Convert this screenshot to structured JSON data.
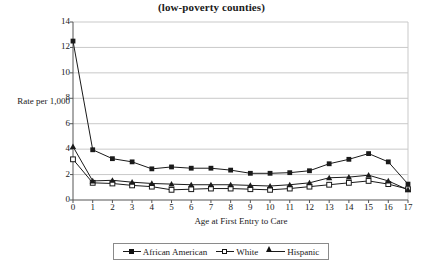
{
  "chart_data": {
    "type": "line",
    "title": "(low-poverty counties)",
    "xlabel": "Age at First Entry to Care",
    "ylabel": "Rate per 1,000",
    "x": [
      0,
      1,
      2,
      3,
      4,
      5,
      6,
      7,
      8,
      9,
      10,
      11,
      12,
      13,
      14,
      15,
      16,
      17
    ],
    "xlim": [
      0,
      17
    ],
    "ylim": [
      0,
      14
    ],
    "ytick_labels": [
      "0",
      "2",
      "4",
      "6",
      "8",
      "10",
      "12",
      "14"
    ],
    "ytick_values": [
      0,
      2,
      4,
      6,
      8,
      10,
      12,
      14
    ],
    "xtick_labels": [
      "0",
      "1",
      "2",
      "3",
      "4",
      "5",
      "6",
      "7",
      "8",
      "9",
      "10",
      "11",
      "12",
      "13",
      "14",
      "15",
      "16",
      "17"
    ],
    "grid": "horizontal",
    "legend_position": "bottom",
    "series": [
      {
        "name": "African American",
        "marker": "filled-square",
        "values": [
          12.5,
          3.95,
          3.25,
          3.0,
          2.45,
          2.6,
          2.5,
          2.5,
          2.35,
          2.1,
          2.1,
          2.15,
          2.3,
          2.85,
          3.2,
          3.65,
          3.0,
          1.25
        ]
      },
      {
        "name": "White",
        "marker": "open-square",
        "values": [
          3.2,
          1.35,
          1.3,
          1.15,
          1.05,
          0.8,
          0.85,
          0.9,
          0.9,
          0.85,
          0.8,
          0.9,
          1.05,
          1.2,
          1.35,
          1.5,
          1.25,
          0.85
        ]
      },
      {
        "name": "Hispanic",
        "marker": "filled-triangle",
        "values": [
          4.2,
          1.5,
          1.55,
          1.4,
          1.3,
          1.25,
          1.2,
          1.2,
          1.2,
          1.15,
          1.1,
          1.2,
          1.35,
          1.75,
          1.8,
          1.95,
          1.5,
          0.8
        ]
      }
    ]
  },
  "legend": {
    "items": [
      {
        "label": "African American"
      },
      {
        "label": "White"
      },
      {
        "label": "Hispanic"
      }
    ]
  },
  "colors": {
    "line": "#1a1a1a",
    "grid": "#c9c9c9",
    "axis": "#555555",
    "background": "#ffffff"
  }
}
